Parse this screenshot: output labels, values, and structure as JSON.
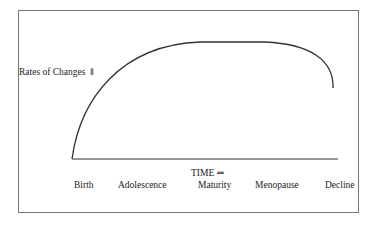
{
  "diagram": {
    "y_axis_label": "Rates of Changes ⇑",
    "x_axis_label": "TIME ⇒",
    "stages": [
      "Birth",
      "Adolescence",
      "Maturity",
      "Menopause",
      "Decline"
    ],
    "curve_description": "Rises steeply from Birth, plateaus through Maturity, drops sharply before Decline"
  }
}
